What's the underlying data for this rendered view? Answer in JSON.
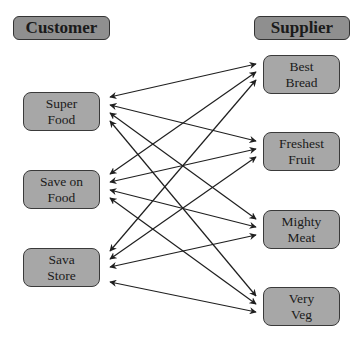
{
  "headers": {
    "customer": "Customer",
    "supplier": "Supplier"
  },
  "customers": [
    {
      "id": "super-food",
      "label": "Super\nFood"
    },
    {
      "id": "save-on-food",
      "label": "Save on\nFood"
    },
    {
      "id": "sava-store",
      "label": "Sava\nStore"
    }
  ],
  "suppliers": [
    {
      "id": "best-bread",
      "label": "Best\nBread"
    },
    {
      "id": "freshest-fruit",
      "label": "Freshest\nFruit"
    },
    {
      "id": "mighty-meat",
      "label": "Mighty\nMeat"
    },
    {
      "id": "very-veg",
      "label": "Very\nVeg"
    }
  ],
  "connections": {
    "type": "bidirectional",
    "pattern": "every customer connected to every supplier",
    "edges": [
      [
        "Super Food",
        "Best Bread"
      ],
      [
        "Super Food",
        "Freshest Fruit"
      ],
      [
        "Super Food",
        "Mighty Meat"
      ],
      [
        "Super Food",
        "Very Veg"
      ],
      [
        "Save on Food",
        "Best Bread"
      ],
      [
        "Save on Food",
        "Freshest Fruit"
      ],
      [
        "Save on Food",
        "Mighty Meat"
      ],
      [
        "Save on Food",
        "Very Veg"
      ],
      [
        "Sava Store",
        "Best Bread"
      ],
      [
        "Sava Store",
        "Freshest Fruit"
      ],
      [
        "Sava Store",
        "Mighty Meat"
      ],
      [
        "Sava Store",
        "Very Veg"
      ]
    ]
  },
  "colors": {
    "box_fill": "#a7a7a7",
    "header_fill": "#8f8f8f",
    "border": "#3a3a3a",
    "arrow": "#1f1f1f",
    "background": "#ffffff"
  }
}
